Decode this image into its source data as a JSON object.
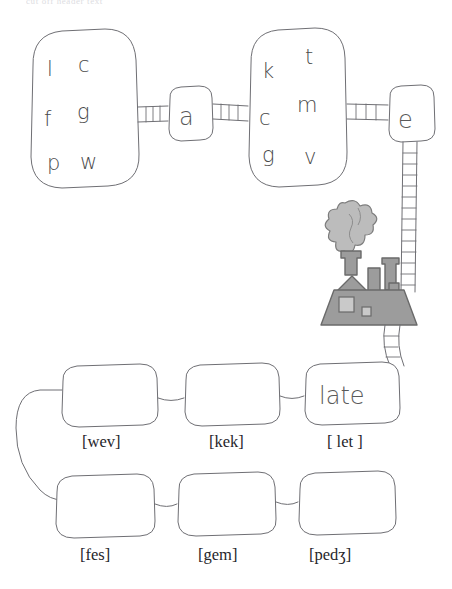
{
  "header": {
    "text": "cut off header text"
  },
  "diagram": {
    "type": "phonology-rule-diagram",
    "top_row": {
      "consonant_set_left": {
        "name": "left-letter-cluster",
        "letters": [
          "l",
          "c",
          "f",
          "g",
          "p",
          "w"
        ]
      },
      "vowel_node_a": {
        "name": "vowel-node-a",
        "label": "a"
      },
      "consonant_set_right": {
        "name": "right-letter-cluster",
        "letters": [
          "k",
          "t",
          "c",
          "m",
          "g",
          "v"
        ]
      },
      "vowel_node_e": {
        "name": "vowel-node-e",
        "label": "e"
      }
    },
    "factory": {
      "name": "factory-illustration",
      "fill": "#9c9c9c",
      "outline": "#6a6a6a",
      "smoke_fill": "#bcbcbc"
    },
    "word_rows": [
      {
        "row": 1,
        "cells": [
          {
            "word": "",
            "transcription": "[wev]"
          },
          {
            "word": "",
            "transcription": "[kek]"
          },
          {
            "word": "late",
            "transcription": "[ let ]"
          }
        ]
      },
      {
        "row": 2,
        "cells": [
          {
            "word": "",
            "transcription": "[fes]"
          },
          {
            "word": "",
            "transcription": "[gem]"
          },
          {
            "word": "",
            "transcription": "[pedʒ]"
          }
        ]
      }
    ]
  },
  "colors": {
    "background": "#ffffff",
    "ink": "#6f6f74",
    "hand_ink": "#4a4a4a",
    "label_ink": "#26262b",
    "factory_gray": "#9c9c9c",
    "smoke_gray": "#bcbcbc"
  }
}
